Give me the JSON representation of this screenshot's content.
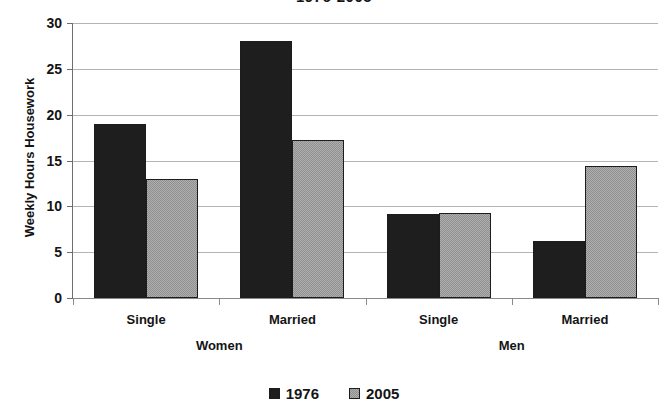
{
  "chart_data": {
    "type": "bar",
    "title": "1976-2005",
    "title_note": "cropped at top edge of image",
    "xlabel": "",
    "ylabel": "Weekly Hours Housework",
    "ylim": [
      0,
      30
    ],
    "ytick_labels": [
      "30",
      "25",
      "20",
      "15",
      "10",
      "5",
      "0"
    ],
    "ytick_values": [
      30,
      25,
      20,
      15,
      10,
      5,
      0
    ],
    "grid": true,
    "legend_position": "bottom-center",
    "groups": [
      "Women",
      "Men"
    ],
    "categories": [
      "Single",
      "Married",
      "Single",
      "Married"
    ],
    "category_group": [
      "Women",
      "Women",
      "Men",
      "Men"
    ],
    "series": [
      {
        "name": "1976",
        "color": "#1e1e1e",
        "values": [
          19.0,
          28.0,
          9.2,
          6.2
        ]
      },
      {
        "name": "2005",
        "color": "#b0b0b0",
        "values": [
          13.0,
          17.2,
          9.3,
          14.4
        ]
      }
    ],
    "bars": [
      {
        "group": "Women",
        "category": "Single",
        "series": "1976",
        "value": 19.0
      },
      {
        "group": "Women",
        "category": "Single",
        "series": "2005",
        "value": 13.0
      },
      {
        "group": "Women",
        "category": "Married",
        "series": "1976",
        "value": 28.0
      },
      {
        "group": "Women",
        "category": "Married",
        "series": "2005",
        "value": 17.2
      },
      {
        "group": "Men",
        "category": "Single",
        "series": "1976",
        "value": 9.2
      },
      {
        "group": "Men",
        "category": "Single",
        "series": "2005",
        "value": 9.3
      },
      {
        "group": "Men",
        "category": "Married",
        "series": "1976",
        "value": 6.2
      },
      {
        "group": "Men",
        "category": "Married",
        "series": "2005",
        "value": 14.4
      }
    ],
    "legend": [
      {
        "label": "1976",
        "swatch": "black-square"
      },
      {
        "label": "2005",
        "swatch": "gray-square"
      }
    ]
  }
}
